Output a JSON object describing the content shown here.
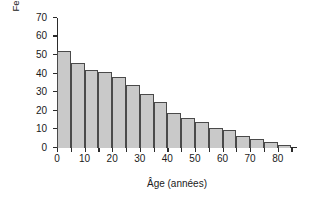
{
  "chart_data": {
    "type": "bar",
    "title": "",
    "xlabel": "Âge (années)",
    "ylabel_line1": "Femmes par année",
    "ylabel_line2": "(millions)",
    "xlim": [
      0,
      87
    ],
    "ylim": [
      0,
      70
    ],
    "grid": false,
    "legend": null,
    "bin_width": 5,
    "bar_color": "#c9c9c9",
    "bar_edge_color": "#4a4a4a",
    "axis_color": "#2b2b2b",
    "background_color": "#ffffff",
    "yticks": [
      0,
      10,
      20,
      30,
      40,
      50,
      60,
      70
    ],
    "ytick_labels": [
      "0",
      "10",
      "20",
      "30",
      "40",
      "50",
      "60",
      "70"
    ],
    "xticks": [
      0,
      5,
      10,
      15,
      20,
      25,
      30,
      35,
      40,
      45,
      50,
      55,
      60,
      65,
      70,
      75,
      80,
      85
    ],
    "xtick_labels_shown": [
      {
        "value": 0,
        "label": "0"
      },
      {
        "value": 10,
        "label": "10"
      },
      {
        "value": 20,
        "label": "20"
      },
      {
        "value": 30,
        "label": "30"
      },
      {
        "value": 40,
        "label": "40"
      },
      {
        "value": 50,
        "label": "50"
      },
      {
        "value": 60,
        "label": "60"
      },
      {
        "value": 70,
        "label": "70"
      },
      {
        "value": 80,
        "label": "80"
      }
    ],
    "categories": [
      "0-5",
      "5-10",
      "10-15",
      "15-20",
      "20-25",
      "25-30",
      "30-35",
      "35-40",
      "40-45",
      "45-50",
      "50-55",
      "55-60",
      "60-65",
      "65-70",
      "70-75",
      "75-80",
      "80-85"
    ],
    "bin_starts": [
      0,
      5,
      10,
      15,
      20,
      25,
      30,
      35,
      40,
      45,
      50,
      55,
      60,
      65,
      70,
      75,
      80
    ],
    "values": [
      52,
      46,
      42,
      41,
      38.5,
      34,
      29,
      25,
      19,
      16,
      14,
      11,
      9.5,
      6.5,
      5,
      3,
      1.5
    ]
  }
}
